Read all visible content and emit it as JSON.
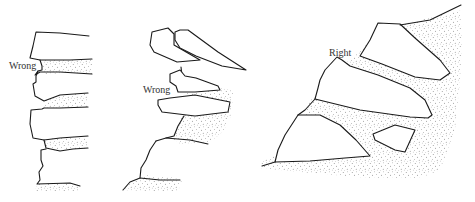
{
  "diagram": {
    "type": "illustration",
    "panels": [
      {
        "id": "panel-1",
        "label": "Wrong",
        "description": "Vertical stacked stones with filled gaps, face vertical"
      },
      {
        "id": "panel-2",
        "label": "Wrong",
        "description": "Stones tilted outward/upward over a slope"
      },
      {
        "id": "panel-3",
        "label": "Right",
        "description": "Stones tilted back into the slope, set into stippled earth"
      }
    ],
    "colors": {
      "ink": "#1a1a1a",
      "label": "#333333",
      "background": "#ffffff",
      "stipple": "#555555"
    }
  }
}
